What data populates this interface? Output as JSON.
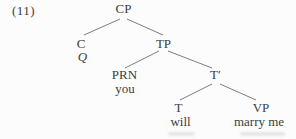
{
  "figure": {
    "number_label": "(11)",
    "background": "#fcfcfc",
    "text_color": "#3c3c3c",
    "line_color": "#6e6e6e",
    "artifact_color": "#9a9a9a"
  },
  "tree": {
    "description": "Syntax tree for example (11): yes-no question structure",
    "nodes": [
      {
        "id": "CP",
        "label": "CP",
        "x": 123.5,
        "y": 2,
        "italic": false
      },
      {
        "id": "C",
        "label": "C",
        "x": 81,
        "y": 37,
        "italic": false
      },
      {
        "id": "Q",
        "label": "Q",
        "x": 82.5,
        "y": 50,
        "italic": true
      },
      {
        "id": "TP",
        "label": "TP",
        "x": 163.5,
        "y": 37,
        "italic": false
      },
      {
        "id": "PRN",
        "label": "PRN",
        "x": 124.5,
        "y": 68,
        "italic": false
      },
      {
        "id": "you",
        "label": "you",
        "x": 125,
        "y": 82,
        "italic": false
      },
      {
        "id": "Tbar",
        "label": "T′",
        "x": 215.5,
        "y": 68,
        "italic": false
      },
      {
        "id": "T",
        "label": "T",
        "x": 178.5,
        "y": 101,
        "italic": false
      },
      {
        "id": "will",
        "label": "will",
        "x": 180.5,
        "y": 115,
        "italic": false
      },
      {
        "id": "VP",
        "label": "VP",
        "x": 261,
        "y": 101,
        "italic": false
      },
      {
        "id": "marry",
        "label": "marry me",
        "x": 259,
        "y": 115,
        "italic": false
      }
    ],
    "edges": [
      {
        "from": "CP",
        "to": "C",
        "x1": 120,
        "y1": 19,
        "x2": 84,
        "y2": 35
      },
      {
        "from": "CP",
        "to": "TP",
        "x1": 127,
        "y1": 19,
        "x2": 163,
        "y2": 35
      },
      {
        "from": "TP",
        "to": "PRN",
        "x1": 159,
        "y1": 51,
        "x2": 125,
        "y2": 68
      },
      {
        "from": "TP",
        "to": "Tbar",
        "x1": 168,
        "y1": 51,
        "x2": 212,
        "y2": 68
      },
      {
        "from": "Tbar",
        "to": "T",
        "x1": 212,
        "y1": 84,
        "x2": 180,
        "y2": 100
      },
      {
        "from": "Tbar",
        "to": "VP",
        "x1": 220,
        "y1": 84,
        "x2": 256,
        "y2": 100
      }
    ]
  }
}
